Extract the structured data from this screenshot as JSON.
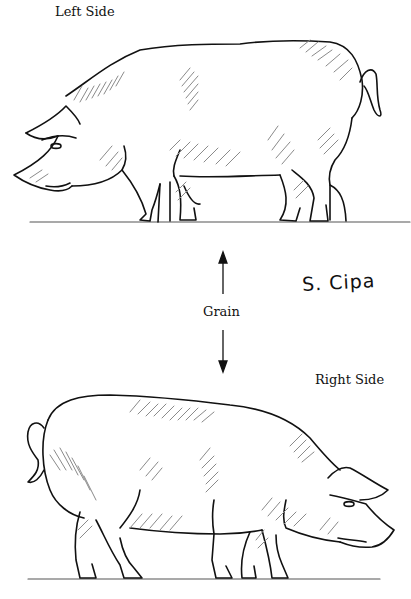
{
  "labels": {
    "top": "Left Side",
    "bottom": "Right Side",
    "grain": "Grain",
    "signature": "S. Cipa"
  },
  "figures": [
    {
      "name": "pig-left-side",
      "facing": "left",
      "description": "Line drawing of a pig with pencil shading, viewed from its left side"
    },
    {
      "name": "pig-right-side",
      "facing": "right",
      "description": "Line drawing of a pig with pencil shading, viewed from its right side"
    }
  ],
  "grain_arrow": {
    "direction": "vertical",
    "ends": [
      "up",
      "down"
    ]
  },
  "colors": {
    "line": "#111111",
    "shading": "#8a8a8a",
    "ground": "#555555",
    "background": "#ffffff"
  }
}
